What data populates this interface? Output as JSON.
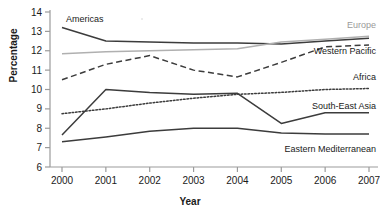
{
  "chart_data": {
    "type": "line",
    "title": "",
    "xlabel": "Year",
    "ylabel": "Percentage",
    "x": [
      2000,
      2001,
      2002,
      2003,
      2004,
      2005,
      2006,
      2007
    ],
    "xtick_labels": [
      "2000",
      "2001",
      "2002",
      "2003",
      "2004",
      "2005",
      "2006",
      "2007"
    ],
    "ytick_labels": [
      "6",
      "7",
      "8",
      "9",
      "10",
      "11",
      "12",
      "13",
      "14"
    ],
    "ylim": [
      6,
      14
    ],
    "xlim": [
      2000,
      2007
    ],
    "grid": false,
    "legend": "inline-labels",
    "series": [
      {
        "name": "Americas",
        "style": "solid",
        "color": "#3c3c3c",
        "label_position": "top-left",
        "values": [
          13.2,
          12.5,
          12.45,
          12.4,
          12.4,
          12.35,
          12.5,
          12.65
        ]
      },
      {
        "name": "Europe",
        "style": "solid",
        "color": "#b0b0b0",
        "label_position": "top-right",
        "values": [
          11.85,
          11.95,
          12.0,
          12.05,
          12.1,
          12.45,
          12.6,
          12.75
        ]
      },
      {
        "name": "Western Pacific",
        "style": "dashed",
        "color": "#3c3c3c",
        "label_position": "right",
        "values": [
          10.5,
          11.3,
          11.75,
          11.0,
          10.65,
          11.4,
          12.2,
          12.3
        ]
      },
      {
        "name": "Africa",
        "style": "dotted",
        "color": "#3c3c3c",
        "label_position": "right",
        "values": [
          8.75,
          9.0,
          9.3,
          9.55,
          9.75,
          9.85,
          10.0,
          10.05
        ]
      },
      {
        "name": "South-East Asia",
        "style": "solid",
        "color": "#3c3c3c",
        "label_position": "right",
        "values": [
          7.65,
          10.0,
          9.85,
          9.75,
          9.8,
          8.25,
          8.8,
          8.8
        ]
      },
      {
        "name": "Eastern Mediterranean",
        "style": "solid",
        "color": "#3c3c3c",
        "label_position": "bottom-right",
        "values": [
          7.3,
          7.55,
          7.85,
          8.0,
          8.0,
          7.75,
          7.7,
          7.7
        ]
      }
    ]
  },
  "axis": {
    "y_title": "Percentage",
    "x_title": "Year"
  },
  "labels": {
    "americas": "Americas",
    "europe": "Europe",
    "western_pacific": "Western Pacific",
    "africa": "Africa",
    "south_east_asia": "South-East Asia",
    "eastern_mediterranean": "Eastern Mediterranean"
  },
  "yticks": [
    "14",
    "13",
    "12",
    "11",
    "10",
    "9",
    "8",
    "7",
    "6"
  ],
  "xticks": [
    "2000",
    "2001",
    "2002",
    "2003",
    "2004",
    "2005",
    "2006",
    "2007"
  ]
}
